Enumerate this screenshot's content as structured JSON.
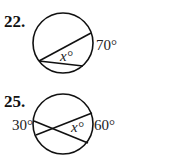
{
  "problems": [
    {
      "number": "22.",
      "arc_label": "70°",
      "angle_label": "x°"
    },
    {
      "number": "25.",
      "left_arc_label": "30°",
      "right_arc_label": "60°",
      "angle_label": "x°"
    }
  ]
}
